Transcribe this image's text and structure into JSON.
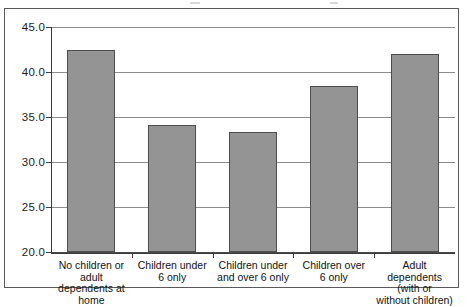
{
  "figure": {
    "title": "",
    "background_color": "#ffffff",
    "frame_color": "#5a5a5a"
  },
  "chart_data": {
    "type": "bar",
    "title": "",
    "xlabel": "",
    "ylabel": "",
    "ylim": [
      20.0,
      45.0
    ],
    "ytick_step": 5.0,
    "grid": true,
    "legend": "none",
    "bar_fill_color": "#949494",
    "bar_edge_color": "#4d4d4d",
    "categories": [
      "No children or adult dependents at home",
      "Children under 6 only",
      "Children under and over 6 only",
      "Children over 6 only",
      "Adult dependents (with or without children)"
    ],
    "category_label_lines": [
      "No children or\nadult\ndependents at\nhome",
      "Children under\n6 only",
      "Children under\nand over 6 only",
      "Children over\n6 only",
      "Adult\ndependents\n(with or\nwithout children)"
    ],
    "values": [
      42.5,
      34.1,
      33.3,
      38.4,
      42.0
    ],
    "ytick_labels": [
      "45.0",
      "40.0",
      "35.0",
      "30.0",
      "25.0",
      "20.0"
    ],
    "ytick_values": [
      45.0,
      40.0,
      35.0,
      30.0,
      25.0,
      20.0
    ]
  }
}
